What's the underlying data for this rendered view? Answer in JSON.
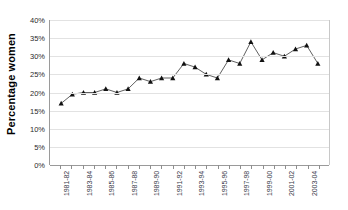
{
  "chart": {
    "type": "line",
    "ylabel": "Percentage women",
    "y_ticks": [
      "40%",
      "35%",
      "30%",
      "25%",
      "20%",
      "15%",
      "10%",
      "5%",
      "0%"
    ]
  },
  "chart_data": {
    "type": "line",
    "title": "",
    "subtitle": "",
    "xlabel": "",
    "ylabel": "Percentage women",
    "ylim": [
      0,
      40
    ],
    "y_ticks": [
      0,
      5,
      10,
      15,
      20,
      25,
      30,
      35,
      40
    ],
    "y_tick_labels": [
      "0%",
      "5%",
      "10%",
      "15%",
      "20%",
      "25%",
      "30%",
      "35%",
      "40%"
    ],
    "grid": true,
    "legend": "none",
    "marker": "triangle",
    "categories": [
      "1981-82",
      "1982-83",
      "1983-84",
      "1984-85",
      "1985-86",
      "1986-87",
      "1987-88",
      "1988-89",
      "1989-90",
      "1990-91",
      "1991-92",
      "1992-93",
      "1993-94",
      "1994-95",
      "1995-96",
      "1996-97",
      "1997-98",
      "1998-99",
      "1999-00",
      "2000-01",
      "2001-02",
      "2002-03",
      "2003-04",
      "2004-05"
    ],
    "x_tick_labels_shown": [
      "1981-82",
      "1983-84",
      "1985-86",
      "1987-88",
      "1989-90",
      "1991-92",
      "1993-94",
      "1995-96",
      "1997-98",
      "1999-00",
      "2001-02",
      "2003-04"
    ],
    "values": [
      17,
      19.5,
      20,
      20,
      21,
      20,
      21,
      24,
      23,
      24,
      24,
      28,
      27,
      25,
      24,
      29,
      28,
      34,
      29,
      31,
      30,
      32,
      33,
      28
    ],
    "units": "percent"
  }
}
